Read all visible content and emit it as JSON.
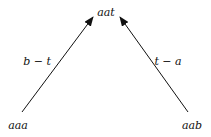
{
  "diagram": {
    "nodes": [
      {
        "id": "top",
        "label": "aat"
      },
      {
        "id": "left",
        "label": "aaa"
      },
      {
        "id": "right",
        "label": "aab"
      }
    ],
    "edges": [
      {
        "from": "aaa",
        "to": "aat",
        "label": "b − t"
      },
      {
        "from": "aab",
        "to": "aat",
        "label": "t − a"
      }
    ]
  }
}
